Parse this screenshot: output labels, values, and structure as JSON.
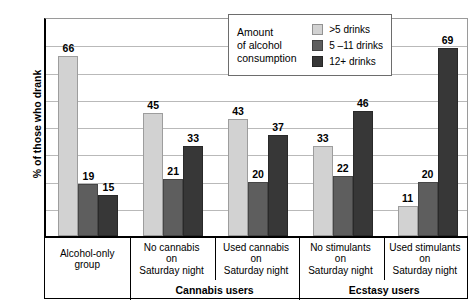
{
  "chart_data": {
    "type": "bar",
    "title": "",
    "xlabel": "",
    "ylabel": "% of those who drank",
    "ylim": [
      0,
      80
    ],
    "yticks": [
      0,
      10,
      20,
      30,
      40,
      50,
      60,
      70,
      80
    ],
    "grid": true,
    "legend_position": "top-center",
    "categories": [
      "Alcohol-only group",
      "No cannabis on Saturday night",
      "Used cannabis on Saturday night",
      "No stimulants on Saturday night",
      "Used stimulants on Saturday night"
    ],
    "category_lines": [
      [
        "Alcohol-only",
        "group"
      ],
      [
        "No cannabis",
        "on",
        "Saturday night"
      ],
      [
        "Used cannabis",
        "on",
        "Saturday night"
      ],
      [
        "No stimulants",
        "on",
        "Saturday night"
      ],
      [
        "Used stimulants",
        "on",
        "Saturday night"
      ]
    ],
    "super_categories": [
      {
        "label": "Cannabis users",
        "spans": [
          1,
          2
        ]
      },
      {
        "label": "Ecstasy users",
        "spans": [
          3,
          4
        ]
      }
    ],
    "series": [
      {
        "name": ">5 drinks",
        "color": "#d2d2d2",
        "values": [
          66,
          45,
          43,
          33,
          11
        ]
      },
      {
        "name": "5 –11 drinks",
        "color": "#5e5e5e",
        "values": [
          19,
          21,
          20,
          22,
          20
        ]
      },
      {
        "name": "12+ drinks",
        "color": "#373737",
        "values": [
          15,
          33,
          37,
          46,
          69
        ]
      }
    ]
  },
  "legend": {
    "title_lines": [
      "Amount",
      "of alcohol",
      "consumption"
    ],
    "items": [
      {
        "label": ">5 drinks",
        "color": "#d2d2d2"
      },
      {
        "label": "5 –11 drinks",
        "color": "#5e5e5e"
      },
      {
        "label": "12+ drinks",
        "color": "#373737"
      }
    ]
  }
}
